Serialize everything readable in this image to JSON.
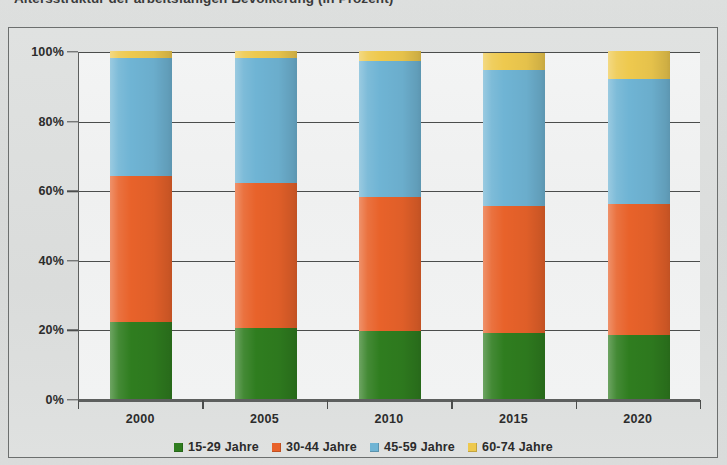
{
  "chart_title": "Altersstruktur der arbeitsfähigen Bevölkerung (in Prozent)",
  "chart_data": {
    "type": "bar",
    "title": "Altersstruktur der arbeitsfähigen Bevölkerung (in Prozent)",
    "subtype": "stacked-100-percent-column",
    "xlabel": "",
    "ylabel": "",
    "ylim": [
      0,
      100
    ],
    "yticks": [
      0,
      20,
      40,
      60,
      80,
      100
    ],
    "ytick_labels": [
      "0%",
      "20%",
      "40%",
      "60%",
      "80%",
      "100%"
    ],
    "grid": true,
    "legend_position": "bottom",
    "categories": [
      "2000",
      "2005",
      "2010",
      "2015",
      "2020"
    ],
    "series": [
      {
        "name": "15-29 Jahre",
        "color": "#2f7d1f",
        "values": [
          22,
          20.5,
          19.5,
          19,
          18.5
        ]
      },
      {
        "name": "30-44 Jahre",
        "color": "#e8622a",
        "values": [
          42,
          41.5,
          38.5,
          36.5,
          37.5
        ]
      },
      {
        "name": "45-59 Jahre",
        "color": "#6fb4d4",
        "values": [
          34,
          36,
          39,
          39,
          36
        ]
      },
      {
        "name": "60-74 Jahre",
        "color": "#eec94e",
        "values": [
          2,
          2,
          3,
          5,
          8
        ]
      }
    ],
    "cumulative_tops": {
      "2000": [
        22,
        64,
        98,
        100
      ],
      "2005": [
        20.5,
        62,
        98,
        100
      ],
      "2010": [
        19.5,
        58,
        97,
        100
      ],
      "2015": [
        19,
        55.5,
        94.5,
        100
      ],
      "2020": [
        18.5,
        56,
        92,
        100
      ]
    }
  },
  "legend": {
    "items": [
      {
        "label": "15-29 Jahre",
        "color": "#2f7d1f"
      },
      {
        "label": "30-44 Jahre",
        "color": "#e8622a"
      },
      {
        "label": "45-59 Jahre",
        "color": "#6fb4d4"
      },
      {
        "label": "60-74 Jahre",
        "color": "#eec94e"
      }
    ]
  }
}
